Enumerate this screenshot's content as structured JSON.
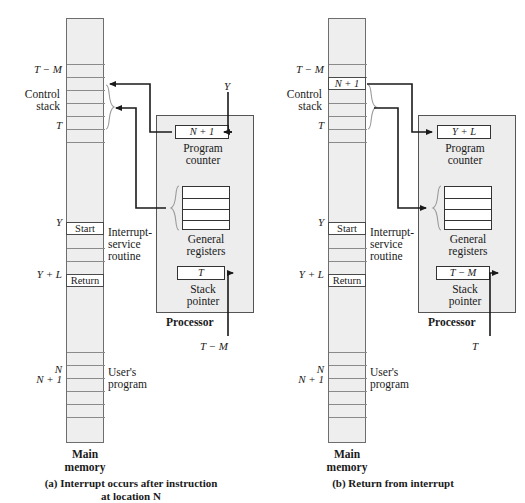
{
  "figure": {
    "colors": {
      "memory_fill": "#eeeeee",
      "processor_fill": "#ededed",
      "register_fill": "#ffffff",
      "line": "#333333",
      "brace": "#8a8a8a"
    }
  },
  "panel_a": {
    "caption_line1": "(a)  Interrupt occurs after instruction",
    "caption_line2": "at location N",
    "memory_footer_line1": "Main",
    "memory_footer_line2": "memory",
    "addresses": {
      "t_minus_m": "T − M",
      "t": "T",
      "y": "Y",
      "y_plus_l": "Y + L",
      "n": "N",
      "n_plus_1": "N + 1"
    },
    "region_labels": {
      "control_stack_line1": "Control",
      "control_stack_line2": "stack",
      "isr_line1": "Interrupt-",
      "isr_line2": "service",
      "isr_line3": "routine",
      "user_line1": "User's",
      "user_line2": "program"
    },
    "stack_cells": [],
    "memory_cells": [
      {
        "label": "Start",
        "italic": false
      },
      {
        "label": "Return",
        "italic": false
      }
    ],
    "processor": {
      "title": "Processor",
      "program_counter": {
        "value": "N + 1",
        "label_line1": "Program",
        "label_line2": "counter"
      },
      "general_registers": {
        "label_line1": "General",
        "label_line2": "registers"
      },
      "stack_pointer": {
        "value": "T",
        "label_line1": "Stack",
        "label_line2": "pointer"
      }
    },
    "external_labels": {
      "incoming_pc": "Y",
      "incoming_sp": "T − M"
    }
  },
  "panel_b": {
    "caption_line1": "(b)  Return from interrupt",
    "caption_line2": "",
    "memory_footer_line1": "Main",
    "memory_footer_line2": "memory",
    "addresses": {
      "t_minus_m": "T − M",
      "t": "T",
      "y": "Y",
      "y_plus_l": "Y + L",
      "n": "N",
      "n_plus_1": "N + 1"
    },
    "region_labels": {
      "control_stack_line1": "Control",
      "control_stack_line2": "stack",
      "isr_line1": "Interrupt-",
      "isr_line2": "service",
      "isr_line3": "routine",
      "user_line1": "User's",
      "user_line2": "program"
    },
    "stack_cells": [
      {
        "label": "N + 1",
        "italic": true
      }
    ],
    "memory_cells": [
      {
        "label": "Start",
        "italic": false
      },
      {
        "label": "Return",
        "italic": false
      }
    ],
    "processor": {
      "title": "Processor",
      "program_counter": {
        "value": "Y + L",
        "label_line1": "Program",
        "label_line2": "counter"
      },
      "general_registers": {
        "label_line1": "General",
        "label_line2": "registers"
      },
      "stack_pointer": {
        "value": "T − M",
        "label_line1": "Stack",
        "label_line2": "pointer"
      }
    },
    "external_labels": {
      "incoming_pc": "",
      "incoming_sp": "T"
    }
  }
}
